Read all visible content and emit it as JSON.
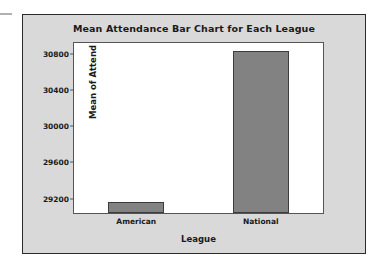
{
  "chart_data": {
    "type": "bar",
    "title": "Mean Attendance Bar Chart for Each League",
    "xlabel": "League",
    "ylabel": "Mean of Attend",
    "categories": [
      "American",
      "National"
    ],
    "values": [
      29160,
      30830
    ],
    "series": [
      {
        "name": "Mean of Attend",
        "values": [
          29160,
          30830
        ]
      }
    ],
    "yticks": [
      29200,
      29600,
      30000,
      30400,
      30800
    ],
    "ytick_labels": [
      "29200",
      "29600",
      "30000",
      "30400",
      "30800"
    ],
    "ylim": [
      29040,
      30920
    ],
    "grid": false,
    "legend": false,
    "bar_color": "#828282",
    "bar_edge_color": "#3c3c3c",
    "plot_background": "#ffffff",
    "panel_background": "#d9d9d9",
    "frame_color": "#2b2b2b"
  }
}
